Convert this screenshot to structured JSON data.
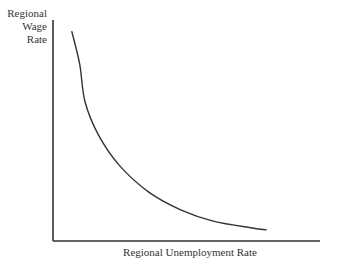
{
  "chart_data": {
    "type": "line",
    "title": "",
    "xlabel": "Regional Unemployment Rate",
    "ylabel": "Regional Wage Rate",
    "ylabel_lines": [
      "Regional",
      "Wage",
      "Rate"
    ],
    "grid": false,
    "legend": null,
    "x_ticks": [],
    "y_ticks": [],
    "series": [
      {
        "name": "Wage curve",
        "description": "Downward-sloping convex curve: wage rate falls as unemployment rises",
        "x": [
          0.07,
          0.1,
          0.12,
          0.17,
          0.25,
          0.36,
          0.48,
          0.6,
          0.74,
          0.8
        ],
        "y": [
          0.95,
          0.8,
          0.63,
          0.48,
          0.34,
          0.22,
          0.14,
          0.09,
          0.06,
          0.05
        ]
      }
    ],
    "xlim": [
      0,
      1
    ],
    "ylim": [
      0,
      1
    ]
  },
  "colors": {
    "axis": "#333333",
    "curve": "#333333",
    "background": "#ffffff"
  }
}
